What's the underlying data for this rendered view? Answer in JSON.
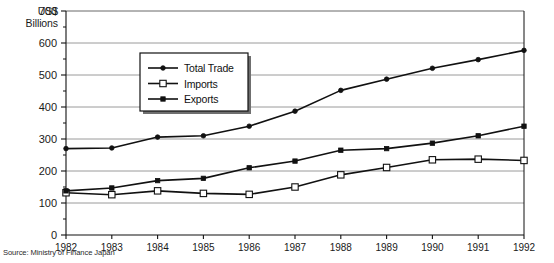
{
  "chart_data": {
    "type": "line",
    "title": "",
    "xlabel": "",
    "ylabel": "US$ Billions",
    "ylabel_line1": "US$",
    "ylabel_line2": "Billions",
    "categories": [
      "1982",
      "1983",
      "1984",
      "1985",
      "1986",
      "1987",
      "1988",
      "1989",
      "1990",
      "1991",
      "1992"
    ],
    "x": [
      1982,
      1983,
      1984,
      1985,
      1986,
      1987,
      1988,
      1989,
      1990,
      1991,
      1992
    ],
    "xlim": [
      1982,
      1992
    ],
    "ylim": [
      0,
      700
    ],
    "yticks": [
      0,
      100,
      200,
      300,
      400,
      500,
      600,
      700
    ],
    "ytick_labels": [
      "0",
      "100",
      "200",
      "300",
      "400",
      "500",
      "600",
      "700"
    ],
    "minor_yticks": [
      50,
      150,
      250,
      350,
      450,
      550,
      650
    ],
    "grid": true,
    "grid_axis": "y",
    "legend_position": "upper-center-left",
    "series": [
      {
        "name": "Total Trade",
        "marker": "dot",
        "values": [
          270,
          272,
          306,
          310,
          340,
          387,
          452,
          487,
          521,
          548,
          577
        ]
      },
      {
        "name": "Imports",
        "marker": "open-square",
        "values": [
          132,
          126,
          138,
          130,
          127,
          150,
          188,
          211,
          235,
          237,
          233
        ]
      },
      {
        "name": "Exports",
        "marker": "filled-square",
        "values": [
          138,
          147,
          170,
          177,
          210,
          231,
          265,
          270,
          287,
          310,
          340
        ]
      }
    ]
  },
  "legend": {
    "items": [
      {
        "label": "Total Trade"
      },
      {
        "label": "Imports"
      },
      {
        "label": "Exports"
      }
    ]
  },
  "footer": {
    "source": "Source: Ministry of Finance Japan"
  },
  "colors": {
    "line": "#111111",
    "grid": "#9a9a9a",
    "axis": "#111111",
    "text": "#1a1a1a",
    "background": "#ffffff",
    "marker_fill_open": "#ffffff"
  }
}
